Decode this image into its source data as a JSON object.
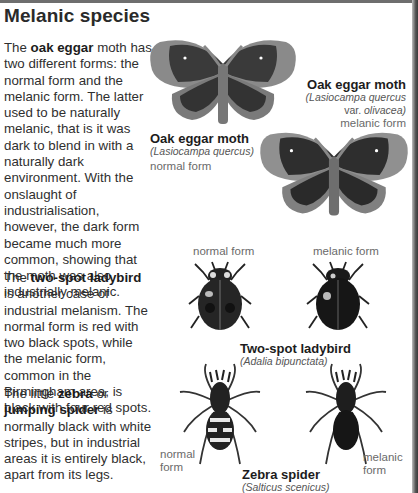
{
  "page": {
    "title": "Melanic species",
    "paragraphs": [
      {
        "pre": "The ",
        "bold": "oak eggar",
        "post": " moth has two different forms: the normal form and the melanic form. The latter used to be naturally melanic, that is it was dark to blend in with a naturally dark environment. With the onslaught of industrialisation, however, the dark form became much more common, showing that the moth was also industrially melanic."
      },
      {
        "pre": "The ",
        "bold": "two-spot ladybird",
        "post": " is another case of industrial melanism. The normal form is red with two black spots, while the melanic form, common in the Birmingham area, is black with four red spots."
      },
      {
        "pre": "The little ",
        "bold": "zebra",
        "mid": " or ",
        "bold2": "jumping spider",
        "post": " is normally black with white stripes, but in industrial areas it is entirely black, apart from its legs."
      }
    ]
  },
  "figures": {
    "moth_melanic": {
      "title": "Oak eggar moth",
      "sci_line1": "(Lasiocampa quercus",
      "sci_line2_pre": "var. ",
      "sci_line2_it": "olivacea)",
      "form": "melanic form"
    },
    "moth_normal": {
      "title": "Oak eggar moth",
      "sci": "(Lasiocampa quercus)",
      "form": "normal form"
    },
    "ladybird": {
      "label_normal": "normal form",
      "label_melanic": "melanic form",
      "title": "Two-spot ladybird",
      "sci": "(Adalia bipunctata)"
    },
    "spider": {
      "label_normal_1": "normal",
      "label_normal_2": "form",
      "label_melanic_1": "melanic",
      "label_melanic_2": "form",
      "title": "Zebra spider",
      "sci": "(Salticus scenicus)"
    }
  }
}
